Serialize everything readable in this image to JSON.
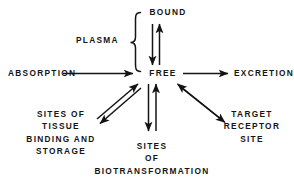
{
  "diagram": {
    "background_color": "#ffffff",
    "line_color": "#141414",
    "nodes": {
      "bound": {
        "label": "BOUND",
        "x": 168,
        "y": 12
      },
      "plasma": {
        "label": "PLASMA",
        "x": 106,
        "y": 40
      },
      "absorption": {
        "label": "ABSORPTION",
        "x": 8,
        "y": 73
      },
      "free": {
        "label": "FREE",
        "x": 163,
        "y": 73
      },
      "excretion": {
        "label": "EXCRETION",
        "x": 234,
        "y": 73
      },
      "tissue": {
        "lines": [
          "SITES OF",
          "TISSUE",
          "BINDING AND",
          "STORAGE"
        ],
        "x": 61,
        "y": 110
      },
      "biotransformation": {
        "lines": [
          "SITES",
          "OF",
          "BIOTRANSFORMATION"
        ],
        "x": 152,
        "y": 142
      },
      "receptor": {
        "lines": [
          "TARGET",
          "RECEPTOR",
          "SITE"
        ],
        "x": 252,
        "y": 110
      }
    },
    "connectors": [
      {
        "name": "absorption-to-free",
        "kind": "single-arrow",
        "from": "absorption",
        "to": "free"
      },
      {
        "name": "free-to-excretion",
        "kind": "single-arrow",
        "from": "free",
        "to": "excretion"
      },
      {
        "name": "free-bound-exchange",
        "kind": "double-arrow",
        "from": "free",
        "to": "bound"
      },
      {
        "name": "free-tissue-exchange",
        "kind": "double-arrow",
        "from": "free",
        "to": "tissue"
      },
      {
        "name": "free-biotransformation-exchange",
        "kind": "double-arrow",
        "from": "free",
        "to": "biotransformation"
      },
      {
        "name": "free-receptor-exchange",
        "kind": "double-arrow",
        "from": "free",
        "to": "receptor"
      },
      {
        "name": "plasma-brace",
        "kind": "curly-brace",
        "spans": [
          "bound",
          "free"
        ]
      }
    ]
  }
}
